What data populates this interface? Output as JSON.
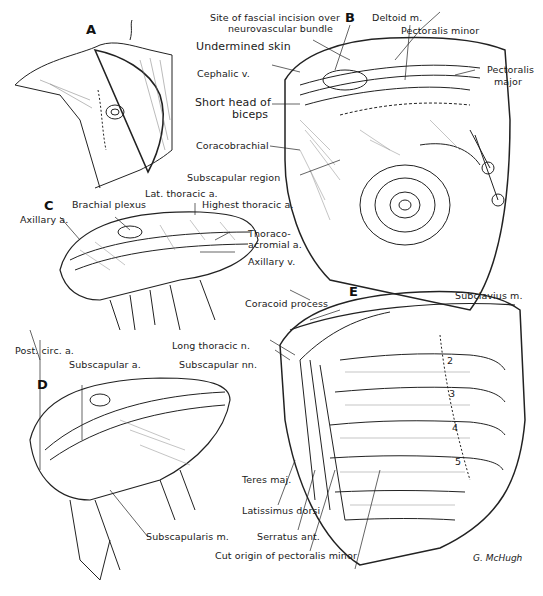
{
  "figure": {
    "panels": [
      {
        "id": "A",
        "label": "A"
      },
      {
        "id": "B",
        "label": "B"
      },
      {
        "id": "C",
        "label": "C"
      },
      {
        "id": "D",
        "label": "D"
      },
      {
        "id": "E",
        "label": "E"
      }
    ],
    "labels": {
      "B": {
        "fascial_incision": "Site of fascial incision over",
        "fascial_incision_2": "neurovascular bundle",
        "undermined_skin": "Undermined skin",
        "cephalic_v": "Cephalic v.",
        "short_head": "Short head of",
        "short_head_2": "biceps",
        "coracobrachial": "Coracobrachial",
        "subscapular_region": "Subscapular region",
        "deltoid": "Deltoid m.",
        "pect_minor": "Pectoralis minor",
        "pect_major": "Pectoralis",
        "pect_major_2": "major"
      },
      "C": {
        "lat_thoracic": "Lat. thoracic a.",
        "brachial_plexus": "Brachial plexus",
        "highest_thoracic": "Highest thoracic a.",
        "axillary_a": "Axillary a.",
        "thoraco": "Thoraco-",
        "thoraco_2": "acromial a.",
        "axillary_v": "Axillary v."
      },
      "D": {
        "post_circ": "Post. circ. a.",
        "subscapular_a": "Subscapular a.",
        "subscapularis": "Subscapularis m."
      },
      "E": {
        "coracoid": "Coracoid process",
        "subclavius": "Subclavius m.",
        "long_thoracic": "Long thoracic n.",
        "subscapular_nn": "Subscapular nn.",
        "teres_maj": "Teres maj.",
        "latissimus": "Latissimus dorsi",
        "serratus": "Serratus ant.",
        "cut_origin": "Cut origin of pectoralis minor",
        "ribs": [
          "2",
          "3",
          "4",
          "5"
        ]
      }
    },
    "signature": "G. McHugh"
  }
}
